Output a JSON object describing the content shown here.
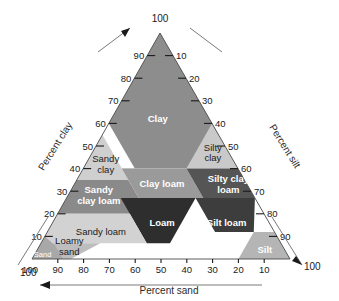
{
  "chart_data": {
    "type": "ternary",
    "axes": [
      {
        "name": "clay",
        "label": "Percent clay",
        "ticks": [
          10,
          20,
          30,
          40,
          50,
          60,
          70,
          80,
          90
        ],
        "apex_value": 100,
        "arrow": "up-right"
      },
      {
        "name": "silt",
        "label": "Percent silt",
        "ticks": [
          10,
          20,
          30,
          40,
          50,
          60,
          70,
          80,
          90
        ],
        "corner_value": 100,
        "arrow": "down-right"
      },
      {
        "name": "sand",
        "label": "Percent sand",
        "ticks": [
          100,
          90,
          80,
          70,
          60,
          50,
          40,
          30,
          20,
          10
        ],
        "arrow": "left"
      }
    ],
    "apex_label": "100",
    "bottom_left_label": "100",
    "bottom_right_label": "100",
    "regions": [
      {
        "key": "clay",
        "label": "Clay",
        "fill": "#8d8d8d",
        "text": "light",
        "style": "bold"
      },
      {
        "key": "sandy_clay",
        "label": "Sandy\nclay",
        "fill": "#cfcfcf",
        "text": "dark",
        "style": "plain"
      },
      {
        "key": "silty_clay",
        "label": "Silty\nclay",
        "fill": "#c9c9c9",
        "text": "dark",
        "style": "plain"
      },
      {
        "key": "sandy_clay_loam",
        "label": "Sandy\nclay loam",
        "fill": "#8a8a8a",
        "text": "light",
        "style": "bold"
      },
      {
        "key": "clay_loam",
        "label": "Clay loam",
        "fill": "#9a9a9a",
        "text": "light",
        "style": "bold"
      },
      {
        "key": "silty_clay_loam",
        "label": "Silty clay\nloam",
        "fill": "#555555",
        "text": "light",
        "style": "bold"
      },
      {
        "key": "loam",
        "label": "Loam",
        "fill": "#2e2e2e",
        "text": "light",
        "style": "bold"
      },
      {
        "key": "silt_loam",
        "label": "Silt loam",
        "fill": "#3d3d3d",
        "text": "light",
        "style": "bold"
      },
      {
        "key": "silt",
        "label": "Silt",
        "fill": "#b5b5b5",
        "text": "light",
        "style": "bold"
      },
      {
        "key": "sandy_loam",
        "label": "Sandy loam",
        "fill": "#d2d2d2",
        "text": "dark",
        "style": "plain"
      },
      {
        "key": "loamy_sand",
        "label": "Loamy\nsand",
        "fill": "#bdbdbd",
        "text": "dark",
        "style": "plain"
      },
      {
        "key": "sand",
        "label": "Sand",
        "fill": "#a8a8a8",
        "text": "light",
        "style": "tiny"
      }
    ]
  },
  "colors": {
    "background": "#ffffff",
    "axis": "#1a1a1a",
    "edge": "#4a4a4a"
  }
}
